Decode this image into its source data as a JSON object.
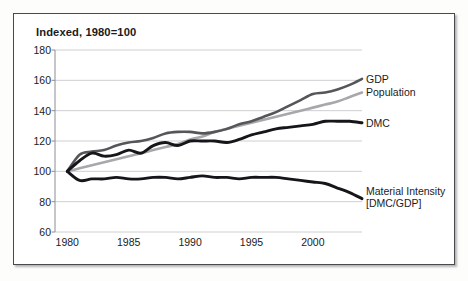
{
  "figure": {
    "title": "Indexed, 1980=100"
  },
  "chart_data": {
    "type": "line",
    "title": "Indexed, 1980=100",
    "xlabel": "",
    "ylabel": "",
    "xlim": [
      1979,
      2004
    ],
    "ylim": [
      60,
      180
    ],
    "grid": true,
    "grid_axis": "y",
    "legend_position": "right-inline-end-labels",
    "y_ticks": [
      180,
      160,
      140,
      120,
      100,
      80,
      60
    ],
    "x_ticks": [
      1980,
      1985,
      1990,
      1995,
      2000
    ],
    "x_tick_labels": [
      "1980",
      "1985",
      "1990",
      "1995",
      "2000"
    ],
    "x": [
      1980,
      1981,
      1982,
      1983,
      1984,
      1985,
      1986,
      1987,
      1988,
      1989,
      1990,
      1991,
      1992,
      1993,
      1994,
      1995,
      1996,
      1997,
      1998,
      1999,
      2000,
      2001,
      2002,
      2003,
      2004
    ],
    "series": [
      {
        "name": "GDP",
        "color": "#56565a",
        "width": 2.6,
        "label": "GDP",
        "end_value": 161,
        "values": [
          100,
          111,
          113,
          114,
          117,
          119,
          120,
          122,
          125,
          126,
          126,
          125,
          126,
          128,
          131,
          133,
          136,
          139,
          143,
          147,
          151,
          152,
          154,
          157,
          161
        ]
      },
      {
        "name": "Population",
        "color": "#a8a8ac",
        "width": 2.6,
        "label": "Population",
        "end_value": 152,
        "values": [
          100,
          102,
          104,
          106,
          108,
          110,
          112,
          114,
          116,
          118,
          121,
          123,
          126,
          128,
          130,
          132,
          134,
          136,
          138,
          140,
          142,
          144,
          146,
          149,
          152
        ]
      },
      {
        "name": "DMC",
        "color": "#15151a",
        "width": 2.9,
        "label": "DMC",
        "end_value": 132,
        "values": [
          100,
          107,
          112,
          110,
          111,
          114,
          112,
          117,
          119,
          117,
          120,
          120,
          120,
          119,
          121,
          124,
          126,
          128,
          129,
          130,
          131,
          133,
          133,
          133,
          132
        ]
      },
      {
        "name": "Material Intensity [DMC/GDP]",
        "color": "#15151a",
        "width": 2.9,
        "label_line1": "Material Intensity",
        "label_line2": "[DMC/GDP]",
        "end_value": 82,
        "values": [
          100,
          94,
          95,
          95,
          96,
          95,
          95,
          96,
          96,
          95,
          96,
          97,
          96,
          96,
          95,
          96,
          96,
          96,
          95,
          94,
          93,
          92,
          89,
          86,
          82
        ]
      }
    ]
  },
  "axes": {
    "y_ticks": [
      "180",
      "160",
      "140",
      "120",
      "100",
      "80",
      "60"
    ],
    "x_ticks": [
      "1980",
      "1985",
      "1990",
      "1995",
      "2000"
    ]
  },
  "labels": {
    "gdp": "GDP",
    "population": "Population",
    "dmc": "DMC",
    "material_intensity_line1": "Material Intensity",
    "material_intensity_line2": "[DMC/GDP]"
  },
  "colors": {
    "gdp": "#56565a",
    "population": "#a8a8ac",
    "dmc": "#15151a",
    "material_intensity": "#15151a",
    "grid": "#c9c9cc",
    "axis": "#8e8e92",
    "frame": "#4a4a4d",
    "text": "#1b1b1d"
  }
}
